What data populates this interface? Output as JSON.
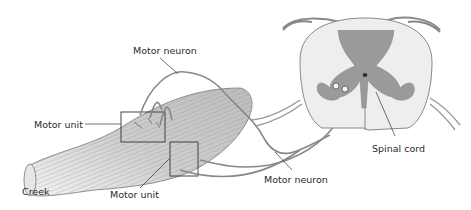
{
  "diagram": {
    "labels": {
      "motor_neuron_top": "Motor neuron",
      "motor_unit_left": "Motor unit",
      "motor_unit_bottom": "Motor unit",
      "motor_neuron_bottom": "Motor neuron",
      "spinal_cord": "Spinal cord",
      "creek": "Creek"
    },
    "colors": {
      "grey_matter": "#9a9a9a",
      "white_matter": "#eeeeee",
      "muscle_line": "#8a8a8a",
      "leader": "#333333"
    }
  }
}
